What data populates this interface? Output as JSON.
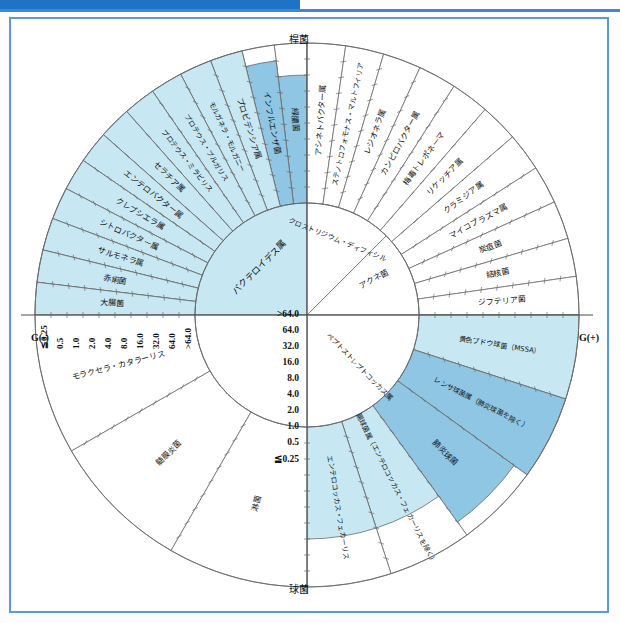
{
  "figure": {
    "type": "antimicrobial-spectrum-wheel",
    "axis_labels": {
      "gram_negative": "G(-)",
      "gram_positive": "G(+)",
      "top": "桿菌",
      "bottom": "球菌"
    },
    "mic_scale_vertical": [
      ">64.0",
      "64.0",
      "32.0",
      "16.0",
      "8.0",
      "4.0",
      "2.0",
      "1.0",
      "0.5",
      "≦0.25"
    ],
    "mic_scale_horizontal": [
      "≦0.25",
      "0.5",
      "1.0",
      "2.0",
      "4.0",
      "8.0",
      "16.0",
      "32.0",
      "64.0",
      ">64.0"
    ],
    "colors": {
      "light": "#c7e7f3",
      "mid": "#8ec6e3",
      "inner_core": "#c7e7f3",
      "outline": "#6b6b6b",
      "frame": "#5b9bd5",
      "topbar": "#1f72c4"
    }
  },
  "chart_data": {
    "type": "pie",
    "xlabel": "G(-) ← → G(+)",
    "ylabel": "桿菌 ↑ ↓ 球菌",
    "ylim": [
      0,
      10
    ],
    "radial_scale": [
      ">64.0",
      "64.0",
      "32.0",
      "16.0",
      "8.0",
      "4.0",
      "2.0",
      "1.0",
      "0.5",
      "≦0.25"
    ],
    "grid": true,
    "legend": "none",
    "inner_ring": [
      {
        "label": "バクテロイデス属",
        "quadrant": "upper-left",
        "fill": "light",
        "level": 10
      },
      {
        "label": "クロストリジウム・ディフィシル",
        "quadrant": "upper-right",
        "fill": "none",
        "level": 0
      },
      {
        "label": "アクネ菌",
        "quadrant": "upper-right",
        "fill": "none",
        "level": 0
      },
      {
        "label": "ペプトストレプトコッカス属",
        "quadrant": "lower-right",
        "fill": "none",
        "level": 0
      }
    ],
    "outer_sectors_upper_left": [
      {
        "label": "緑膿菌",
        "fill": "mid",
        "level": 8
      },
      {
        "label": "インフルエンザ菌",
        "fill": "mid",
        "level": 9
      },
      {
        "label": "プロビデンシア属",
        "fill": "light",
        "level": 10
      },
      {
        "label": "モルガネラ・モルガニー",
        "fill": "light",
        "level": 10
      },
      {
        "label": "プロテウス・ブルガリス",
        "fill": "light",
        "level": 10
      },
      {
        "label": "プロテウス・ミラビリス",
        "fill": "light",
        "level": 10
      },
      {
        "label": "セラチア属",
        "fill": "light",
        "level": 10
      },
      {
        "label": "エンテロバクター属",
        "fill": "light",
        "level": 10
      },
      {
        "label": "クレブシエラ属",
        "fill": "light",
        "level": 10
      },
      {
        "label": "シトロバクター属",
        "fill": "light",
        "level": 10
      },
      {
        "label": "サルモネラ属",
        "fill": "light",
        "level": 10
      },
      {
        "label": "赤痢菌",
        "fill": "light",
        "level": 10
      },
      {
        "label": "大腸菌",
        "fill": "light",
        "level": 10
      }
    ],
    "outer_sectors_upper_right": [
      {
        "label": "アシネトバクター属",
        "fill": "none",
        "level": 0
      },
      {
        "label": "ステノトロフォモナス・マルトフィリア",
        "fill": "none",
        "level": 0
      },
      {
        "label": "レジオネラ属",
        "fill": "none",
        "level": 0
      },
      {
        "label": "カンピロバクター属",
        "fill": "none",
        "level": 0
      },
      {
        "label": "梅毒トレポネーマ",
        "fill": "none",
        "level": 0
      },
      {
        "label": "リケッチア属",
        "fill": "none",
        "level": 0
      },
      {
        "label": "クラミジア属",
        "fill": "none",
        "level": 0
      },
      {
        "label": "マイコプラズマ属",
        "fill": "none",
        "level": 0
      },
      {
        "label": "炭疽菌",
        "fill": "none",
        "level": 0
      },
      {
        "label": "結核菌",
        "fill": "none",
        "level": 0
      },
      {
        "label": "ジフテリア菌",
        "fill": "none",
        "level": 0
      }
    ],
    "outer_sectors_lower_right": [
      {
        "label": "黄色ブドウ球菌（MSSA）",
        "fill": "light",
        "level": 10
      },
      {
        "label": "レンサ球菌属（肺炎球菌を除く）",
        "fill": "mid",
        "level": 10
      },
      {
        "label": "肺炎球菌",
        "fill": "mid",
        "level": 9
      },
      {
        "label": "腸球菌属（エンテロコッカス・フェカーリスを除く）",
        "fill": "light",
        "level": 7
      },
      {
        "label": "エンテロコッカス・フェカーリス",
        "fill": "light",
        "level": 7
      }
    ],
    "outer_sectors_lower_left": [
      {
        "label": "モラクセラ・カタラーリス",
        "fill": "none",
        "level": 0
      },
      {
        "label": "髄膜炎菌",
        "fill": "none",
        "level": 0
      },
      {
        "label": "淋菌",
        "fill": "none",
        "level": 0
      }
    ]
  }
}
